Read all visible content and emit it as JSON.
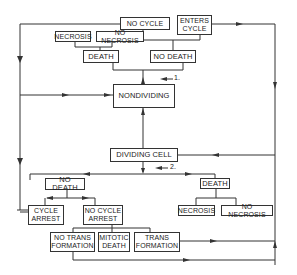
{
  "diagram": {
    "nodes": {
      "no_cycle": "NO CYCLE",
      "enters_cycle": "ENTERS\nCYCLE",
      "necrosis_top": "NECROSIS",
      "no_necrosis_top": "NO NECROSIS",
      "death_top": "DEATH",
      "no_death_top": "NO DEATH",
      "nondividing": "NONDIVIDING",
      "dividing_cell": "DIVIDING CELL",
      "no_death_bottom": "NO DEATH",
      "death_bottom": "DEATH",
      "cycle_arrest": "CYCLE\nARREST",
      "no_cycle_arrest": "NO CYCLE\nARREST",
      "necrosis_bottom": "NECROSIS",
      "no_necrosis_bottom": "NO NECROSIS",
      "no_transformation": "NO TRANS\nFORMATION",
      "mitotic_death": "MITOTIC\nDEATH",
      "transformation": "TRANS\nFORMATION"
    },
    "labels": {
      "step1": "1.",
      "step2": "2."
    },
    "colors": {
      "line": "#333333",
      "box_border": "#333333",
      "background": "#ffffff"
    }
  }
}
